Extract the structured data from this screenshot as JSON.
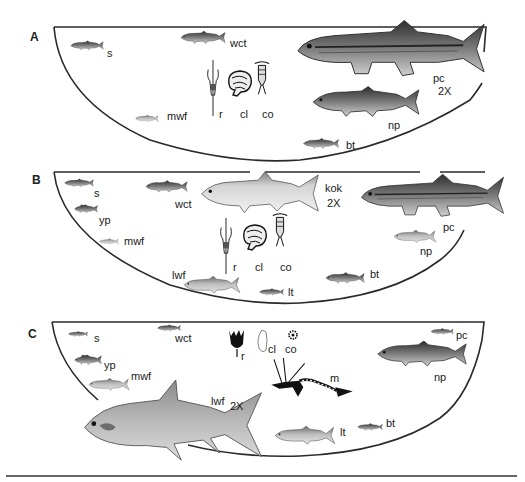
{
  "figure": {
    "panels": [
      {
        "id": "A",
        "letter": "A",
        "fish": [
          {
            "code": "s",
            "label": "s"
          },
          {
            "code": "wct",
            "label": "wct"
          },
          {
            "code": "mwf",
            "label": "mwf"
          },
          {
            "code": "pc",
            "label": "pc",
            "scale": "2X"
          },
          {
            "code": "np",
            "label": "np"
          },
          {
            "code": "bt",
            "label": "bt"
          }
        ],
        "zooplankton": [
          {
            "code": "r",
            "label": "r"
          },
          {
            "code": "cl",
            "label": "cl"
          },
          {
            "code": "co",
            "label": "co"
          }
        ]
      },
      {
        "id": "B",
        "letter": "B",
        "fish": [
          {
            "code": "s",
            "label": "s"
          },
          {
            "code": "yp",
            "label": "yp"
          },
          {
            "code": "mwf",
            "label": "mwf"
          },
          {
            "code": "wct",
            "label": "wct"
          },
          {
            "code": "kok",
            "label": "kok",
            "scale": "2X"
          },
          {
            "code": "pc",
            "label": "pc"
          },
          {
            "code": "np",
            "label": "np"
          },
          {
            "code": "lwf",
            "label": "lwf"
          },
          {
            "code": "lt",
            "label": "lt"
          },
          {
            "code": "bt",
            "label": "bt"
          }
        ],
        "zooplankton": [
          {
            "code": "r",
            "label": "r"
          },
          {
            "code": "cl",
            "label": "cl"
          },
          {
            "code": "co",
            "label": "co"
          }
        ]
      },
      {
        "id": "C",
        "letter": "C",
        "fish": [
          {
            "code": "s",
            "label": "s"
          },
          {
            "code": "wct",
            "label": "wct"
          },
          {
            "code": "yp",
            "label": "yp"
          },
          {
            "code": "mwf",
            "label": "mwf"
          },
          {
            "code": "lwf",
            "label": "lwf",
            "scale": "2X"
          },
          {
            "code": "pc",
            "label": "pc"
          },
          {
            "code": "np",
            "label": "np"
          },
          {
            "code": "lt",
            "label": "lt"
          },
          {
            "code": "bt",
            "label": "bt"
          }
        ],
        "zooplankton": [
          {
            "code": "r",
            "label": "r"
          },
          {
            "code": "cl",
            "label": "cl"
          },
          {
            "code": "co",
            "label": "co"
          },
          {
            "code": "m",
            "label": "m"
          }
        ]
      }
    ]
  }
}
